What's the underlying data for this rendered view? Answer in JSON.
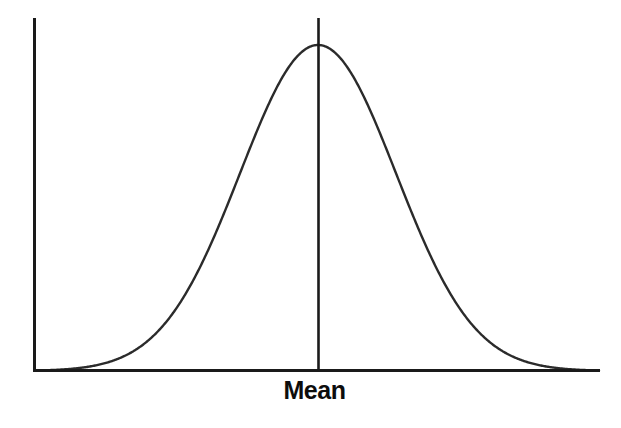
{
  "figure": {
    "background_color": "#ffffff",
    "line_color": "#1a1a1a",
    "curve_color": "#2b2b2b",
    "width": 621,
    "height": 428
  },
  "labels": {
    "mean": "Mean"
  },
  "chart_data": {
    "type": "line",
    "title": "",
    "subtitle": "",
    "xlabel": "",
    "ylabel": "",
    "grid": false,
    "legend": null,
    "axes": {
      "y_axis": {
        "x_px": 33,
        "y_top_px": 18,
        "y_bottom_px": 371,
        "ticks": [],
        "tick_labels": []
      },
      "x_axis": {
        "y_px": 371,
        "x_left_px": 33,
        "x_right_px": 600,
        "ticks": [],
        "tick_labels": []
      },
      "xlim": [
        -3.65,
        3.65
      ],
      "ylim": [
        0,
        1
      ]
    },
    "annotations": [
      {
        "text": "Mean",
        "x": 0,
        "x_px": 318,
        "y_px": 398,
        "bold": true,
        "position": "below-axis-centered"
      }
    ],
    "series": [
      {
        "name": "Normal distribution",
        "kind": "gaussian",
        "mean": 0,
        "std_dev": 1,
        "peak_px": {
          "x": 318,
          "y": 45
        },
        "baseline_px": 371,
        "sigma_px": 78,
        "x": [
          -3.65,
          -3.4,
          -3.15,
          -2.9,
          -2.65,
          -2.4,
          -2.15,
          -1.9,
          -1.65,
          -1.4,
          -1.15,
          -0.9,
          -0.65,
          -0.4,
          -0.15,
          0,
          0.15,
          0.4,
          0.65,
          0.9,
          1.15,
          1.4,
          1.65,
          1.9,
          2.15,
          2.4,
          2.65,
          2.9,
          3.15,
          3.4,
          3.65
        ],
        "y": [
          0.0013,
          0.003,
          0.0071,
          0.0155,
          0.0305,
          0.0561,
          0.0972,
          0.1645,
          0.2562,
          0.3753,
          0.5161,
          0.667,
          0.81,
          0.9231,
          0.9888,
          1.0,
          0.9888,
          0.9231,
          0.81,
          0.667,
          0.5161,
          0.3753,
          0.2562,
          0.1645,
          0.0972,
          0.0561,
          0.0305,
          0.0155,
          0.0071,
          0.003,
          0.0013
        ]
      }
    ],
    "mean_marker": {
      "x": 0,
      "x_px": 318,
      "y_top_px": 18,
      "y_bottom_px": 371,
      "label": "Mean"
    }
  }
}
